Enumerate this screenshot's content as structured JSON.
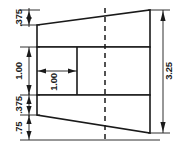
{
  "drawing": {
    "type": "orthographic-section-view",
    "canvas": {
      "width": 182,
      "height": 150
    },
    "units": "inches",
    "dimensions": {
      "upper_flange_thickness": ".375",
      "web_height": "1.00",
      "lower_flange_thickness": ".375",
      "bottom_taper_height": ".75",
      "web_width": "1.00",
      "overall_height": "3.25"
    },
    "labels": {
      "upper_flange": ".375",
      "web_height": "1.00",
      "lower_flange": ".375",
      "bottom_taper": ".75",
      "web_width": "1.00",
      "overall_height": "3.25"
    },
    "colors": {
      "line": "#1a1a1a",
      "fill": "#ffffff",
      "background": "#ffffff"
    },
    "geometry": {
      "left_face_x": 37,
      "right_face_x": 150,
      "centerline_x": 105,
      "web_inner_x": 77,
      "top_right_y": 10,
      "top_left_y": 25,
      "upper_band_bottom_y": 47,
      "lower_band_top_y": 95,
      "bottom_left_y": 115,
      "bottom_right_y": 133
    },
    "features": [
      "upper-tapered-flange",
      "center-web-band",
      "lower-tapered-flange",
      "vertical-centerline"
    ]
  }
}
